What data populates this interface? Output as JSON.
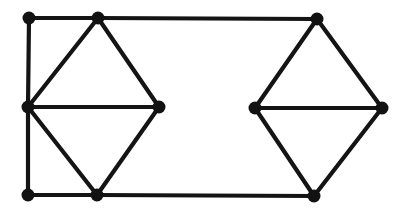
{
  "figure": {
    "kind": "undirected-graph-drawing",
    "background_color": "#ffffff",
    "ink_color": "#141414",
    "vertex_color": "#121212",
    "canvas": {
      "width": 401,
      "height": 211
    },
    "vertex_radius": 6.5,
    "edge_width": 4.2
  },
  "chart_data": {
    "type": "scatter",
    "title": "",
    "xlabel": "",
    "ylabel": "",
    "xlim": [
      0,
      401
    ],
    "ylim": [
      0,
      211
    ],
    "grid": false,
    "legend": "none",
    "vertex_count": 10,
    "edge_count": 15,
    "nodes": [
      {
        "id": "A",
        "label": "",
        "x": 29,
        "y": 18,
        "degree": 2
      },
      {
        "id": "B",
        "label": "",
        "x": 98,
        "y": 18,
        "degree": 4
      },
      {
        "id": "C",
        "label": "",
        "x": 28,
        "y": 107,
        "degree": 5
      },
      {
        "id": "D",
        "label": "",
        "x": 159,
        "y": 107,
        "degree": 3
      },
      {
        "id": "E",
        "label": "",
        "x": 28,
        "y": 195,
        "degree": 2
      },
      {
        "id": "F",
        "label": "",
        "x": 97,
        "y": 195,
        "degree": 4
      },
      {
        "id": "G",
        "label": "",
        "x": 317,
        "y": 19,
        "degree": 3
      },
      {
        "id": "H",
        "label": "",
        "x": 255,
        "y": 108,
        "degree": 3
      },
      {
        "id": "I",
        "label": "",
        "x": 382,
        "y": 108,
        "degree": 3
      },
      {
        "id": "J",
        "label": "",
        "x": 314,
        "y": 196,
        "degree": 3
      }
    ],
    "edges": [
      {
        "from": "A",
        "to": "B"
      },
      {
        "from": "A",
        "to": "C"
      },
      {
        "from": "C",
        "to": "E"
      },
      {
        "from": "E",
        "to": "F"
      },
      {
        "from": "B",
        "to": "C"
      },
      {
        "from": "B",
        "to": "D"
      },
      {
        "from": "C",
        "to": "D"
      },
      {
        "from": "C",
        "to": "F"
      },
      {
        "from": "D",
        "to": "F"
      },
      {
        "from": "B",
        "to": "G"
      },
      {
        "from": "F",
        "to": "J"
      },
      {
        "from": "G",
        "to": "H"
      },
      {
        "from": "G",
        "to": "I"
      },
      {
        "from": "H",
        "to": "I"
      },
      {
        "from": "H",
        "to": "J"
      },
      {
        "from": "I",
        "to": "J"
      }
    ]
  }
}
